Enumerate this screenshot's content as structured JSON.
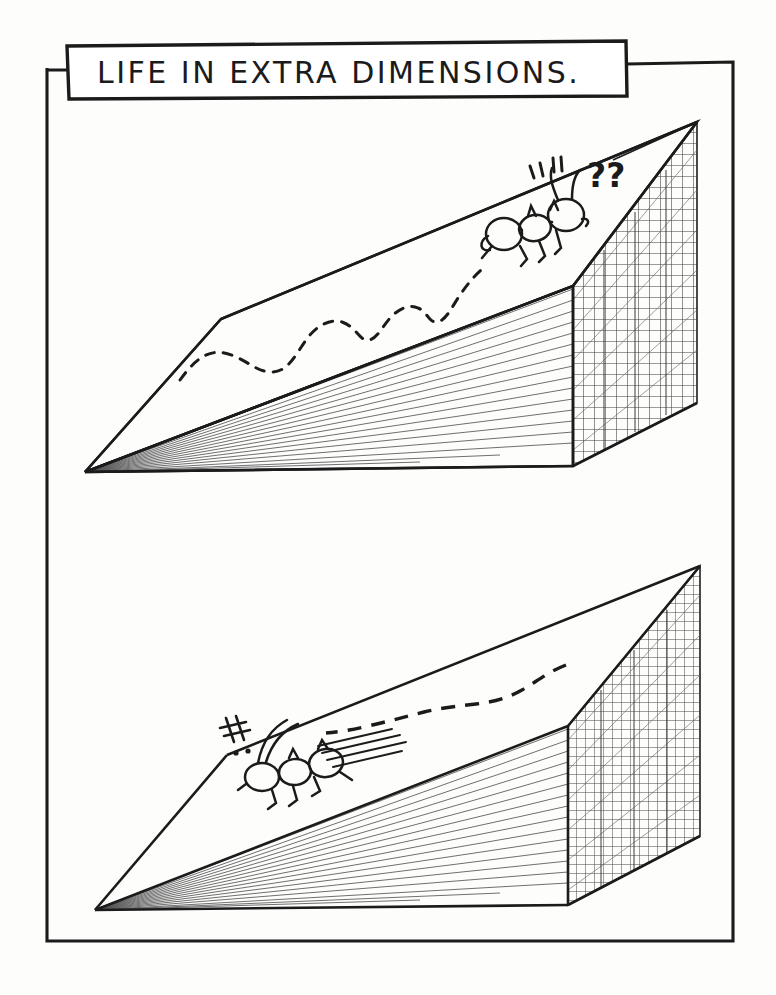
{
  "document": {
    "kind": "hand-drawn cartoon illustration",
    "background_color": "#fdfdfc",
    "ink_color": "#1b1b1b",
    "medium": "pen on paper, photocopied"
  },
  "title_box": {
    "text": "LIFE IN EXTRA DIMENSIONS.",
    "style": "hand-lettered capitals",
    "border_color": "#1b1b1b"
  },
  "frame": {
    "label": "outer hand-drawn border",
    "color": "#1b1b1b"
  },
  "panels": [
    {
      "id": "top-panel",
      "label": "Ant meets the extra dimension",
      "slab": {
        "label": "flat ground slab drawn in perspective",
        "top_face": "blank plane",
        "front_face": "diagonal hatch shading",
        "end_face": "cross-hatched grid wall"
      },
      "ant": {
        "label": "ant facing right toward the grid wall",
        "direction": "right",
        "segments": [
          "abdomen",
          "thorax",
          "head"
        ],
        "antennae": 2,
        "legs": 6
      },
      "trail": {
        "label": "wandering dashed path",
        "style": "dashed",
        "shape": "wavy meander"
      },
      "annotations": [
        {
          "name": "question-marks",
          "text": "??"
        },
        {
          "name": "surprise-strokes",
          "text": "„“"
        }
      ]
    },
    {
      "id": "bottom-panel",
      "label": "Ant runs back along the plane",
      "slab": {
        "label": "flat ground slab drawn in perspective",
        "top_face": "blank plane",
        "front_face": "diagonal hatch shading",
        "end_face": "cross-hatched grid wall"
      },
      "ant": {
        "label": "ant running left away from the grid wall",
        "direction": "left",
        "segments": [
          "abdomen",
          "thorax",
          "head"
        ],
        "antennae": 2,
        "legs": 6
      },
      "trail": {
        "label": "dashed return path from the grid wall",
        "style": "dashed",
        "shape": "gentle curve"
      },
      "annotations": [
        {
          "name": "impact-marks",
          "text": "strokes and dots at the slab edge"
        },
        {
          "name": "speed-lines",
          "text": "motion streaks behind the ant"
        }
      ]
    }
  ]
}
